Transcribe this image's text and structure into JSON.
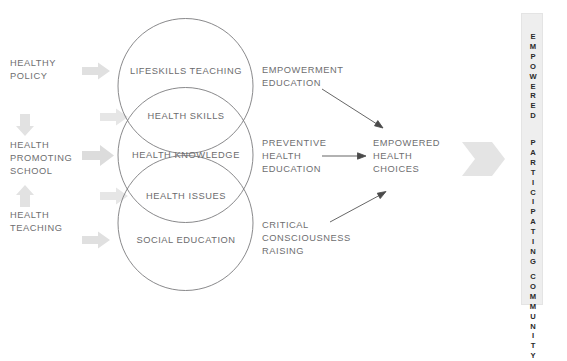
{
  "colors": {
    "text": "#6e6e70",
    "circle_stroke": "#7a7a7c",
    "arrow_gray": "#dedede",
    "arrow_dark": "#3a3a3a",
    "box_fill": "#eeeeee",
    "box_text": "#2a2a2a",
    "background": "#ffffff"
  },
  "inputs": {
    "items": [
      {
        "label": "HEALTHY\nPOLICY",
        "name": "healthy-policy"
      },
      {
        "label": "HEALTH\nPROMOTING\nSCHOOL",
        "name": "health-promoting-school"
      },
      {
        "label": "HEALTH\nTEACHING",
        "name": "health-teaching"
      }
    ],
    "connector_down": "down-arrow-icon",
    "connector_up": "up-arrow-icon",
    "feed_arrows": [
      "feed-arrow-lifeskills",
      "feed-arrow-health-skills",
      "feed-arrow-health-knowledge",
      "feed-arrow-health-issues",
      "feed-arrow-social-education"
    ]
  },
  "venn": {
    "circles": [
      {
        "label": "LIFESKILLS TEACHING",
        "name": "circle-lifeskills-teaching"
      },
      {
        "label": "HEALTH KNOWLEDGE",
        "name": "circle-health-knowledge"
      },
      {
        "label": "SOCIAL EDUCATION",
        "name": "circle-social-education"
      }
    ],
    "overlaps": [
      {
        "label": "HEALTH SKILLS",
        "name": "overlap-health-skills"
      },
      {
        "label": "HEALTH ISSUES",
        "name": "overlap-health-issues"
      }
    ]
  },
  "processes": [
    {
      "label": "EMPOWERMENT\nEDUCATION",
      "name": "empowerment-education",
      "arrow": "diagonal-down-right"
    },
    {
      "label": "PREVENTIVE\nHEALTH\nEDUCATION",
      "name": "preventive-health-education",
      "arrow": "horizontal-right"
    },
    {
      "label": "CRITICAL\nCONSCIOUSNESS\nRAISING",
      "name": "critical-consciousness-raising",
      "arrow": "diagonal-up-right"
    }
  ],
  "outcome": {
    "label": "EMPOWERED\nHEALTH\nCHOICES",
    "name": "empowered-health-choices"
  },
  "final": {
    "arrow": "big-right-chevron",
    "vertical_lines": [
      "EMPOWERED",
      "PARTICIPATING",
      "COMMUNITY"
    ]
  }
}
